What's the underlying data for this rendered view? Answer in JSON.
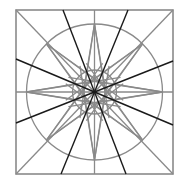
{
  "diagram": {
    "canvas": {
      "width": 180,
      "height": 183,
      "background": "#ffffff"
    },
    "colors": {
      "construction": "#8a8a8a",
      "emphasis": "#1a1a1a"
    },
    "square": {
      "x": 16,
      "y": 10,
      "width": 157,
      "height": 164
    },
    "center": {
      "x": 94.5,
      "y": 92
    },
    "circles": [
      {
        "name": "outer-circle",
        "r": 68
      },
      {
        "name": "inner-circle",
        "r": 22
      }
    ],
    "star": {
      "points": 8,
      "outer_radius": 68,
      "inner_radius": 20,
      "line_style": "gray"
    },
    "axis_lines": [
      "vertical",
      "horizontal",
      "diagonal-main",
      "diagonal-anti"
    ],
    "emphasis_lines": [
      {
        "name": "dark-line-1",
        "top_x": 63,
        "bottom_x": 126
      },
      {
        "name": "dark-line-2",
        "top_x": 128,
        "bottom_x": 61
      },
      {
        "name": "dark-line-3",
        "left_y": 59,
        "right_y": 125
      },
      {
        "name": "dark-line-4",
        "left_y": 123,
        "right_y": 61
      }
    ]
  }
}
